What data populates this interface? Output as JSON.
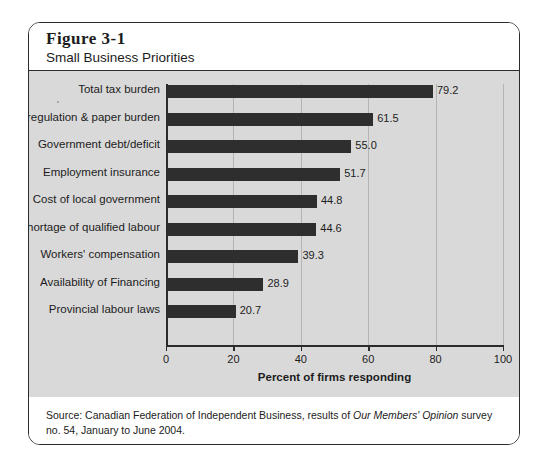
{
  "figure": {
    "number": "Figure 3-1",
    "title": "Small Business Priorities"
  },
  "source": {
    "prefix": "Source: Canadian Federation of Independent Business, results of ",
    "italic": "Our Members' Opinion",
    "suffix": " survey no. 54, January to June 2004."
  },
  "colors": {
    "bar": "#2e2e2e",
    "plot_background": "#d9d9d9",
    "gridline": "#b4b4b4",
    "axis": "#2b2b2b",
    "frame": "#2b2b2b",
    "panel": "#ffffff"
  },
  "chart_data": {
    "type": "bar",
    "orientation": "horizontal",
    "title": "Small Business Priorities",
    "xlabel": "Percent of firms responding",
    "ylabel": "",
    "xlim": [
      0,
      100
    ],
    "xticks": [
      0,
      20,
      40,
      60,
      80,
      100
    ],
    "xticklabels": [
      "0",
      "20",
      "40",
      "60",
      "80",
      "100"
    ],
    "grid": "vertical",
    "legend": "none",
    "categories": [
      "Total tax burden",
      "Gov't regulation & paper burden",
      "Government debt/deficit",
      "Employment insurance",
      "Cost of local government",
      "Shortage of qualified labour",
      "Workers' compensation",
      "Availability of Financing",
      "Provincial labour laws"
    ],
    "values": [
      79.2,
      61.5,
      55.0,
      51.7,
      44.8,
      44.6,
      39.3,
      28.9,
      20.7
    ],
    "value_labels": [
      "79.2",
      "61.5",
      "55.0",
      "51.7",
      "44.8",
      "44.6",
      "39.3",
      "28.9",
      "20.7"
    ]
  }
}
